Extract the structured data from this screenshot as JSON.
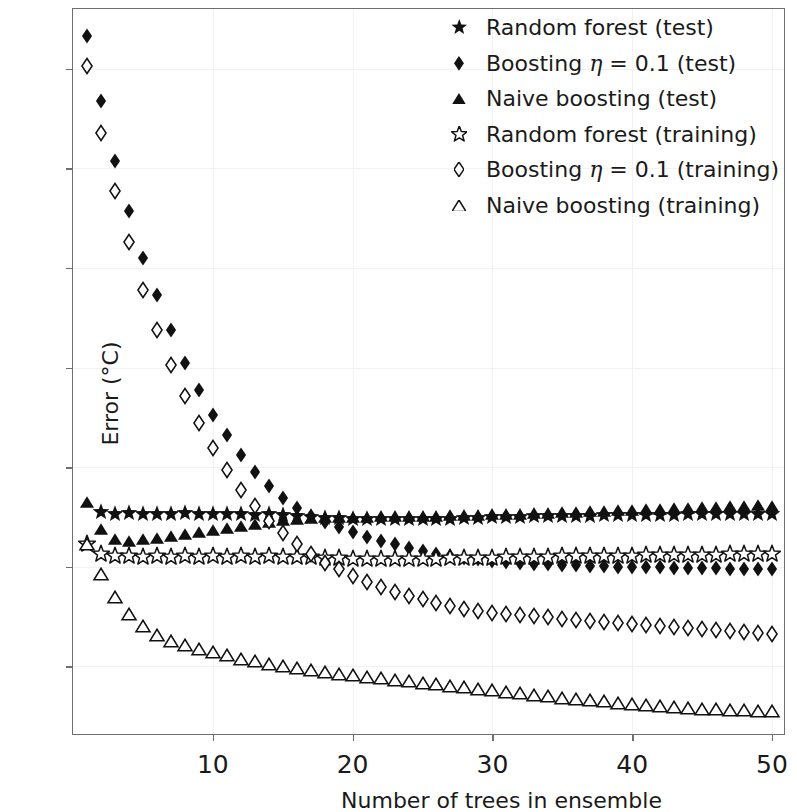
{
  "chart_data": {
    "type": "scatter",
    "title": "",
    "xlabel": "Number of trees in ensemble",
    "ylabel": "Error (°C)",
    "xlim": [
      0,
      51
    ],
    "ylim": [
      2.6,
      17.2
    ],
    "xticks": [
      10,
      20,
      30,
      40,
      50
    ],
    "yticks": [
      4,
      6,
      8,
      10,
      12,
      14,
      16
    ],
    "grid": true,
    "legend_position": "upper right",
    "x": [
      1,
      2,
      3,
      4,
      5,
      6,
      7,
      8,
      9,
      10,
      11,
      12,
      13,
      14,
      15,
      16,
      17,
      18,
      19,
      20,
      21,
      22,
      23,
      24,
      25,
      26,
      27,
      28,
      29,
      30,
      31,
      32,
      33,
      34,
      35,
      36,
      37,
      38,
      39,
      40,
      41,
      42,
      43,
      44,
      45,
      46,
      47,
      48,
      49,
      50
    ],
    "series": [
      {
        "name": "Random forest (test)",
        "marker": "star-filled",
        "filled": true,
        "values": [
          null,
          7.1,
          7.05,
          7.08,
          7.05,
          7.06,
          7.05,
          7.07,
          7.05,
          7.06,
          7.05,
          7.05,
          7.04,
          7.05,
          7.03,
          7.02,
          7.0,
          6.98,
          6.97,
          6.95,
          6.96,
          6.95,
          6.96,
          6.95,
          6.96,
          6.95,
          6.96,
          6.97,
          6.98,
          6.99,
          7.0,
          7.0,
          7.01,
          7.01,
          7.02,
          7.02,
          7.02,
          7.03,
          7.03,
          7.03,
          7.04,
          7.04,
          7.04,
          7.05,
          7.05,
          7.05,
          7.05,
          7.05,
          7.05,
          7.05
        ]
      },
      {
        "name": "Boosting η = 0.1 (test)",
        "marker": "diamond-filled",
        "filled": true,
        "values": [
          16.65,
          15.35,
          14.15,
          13.15,
          12.2,
          11.45,
          10.75,
          10.1,
          9.55,
          9.05,
          8.65,
          8.25,
          7.9,
          7.62,
          7.38,
          7.18,
          7.02,
          6.9,
          6.8,
          6.7,
          6.6,
          6.52,
          6.45,
          6.38,
          6.32,
          6.26,
          6.22,
          6.18,
          6.15,
          6.12,
          6.1,
          6.08,
          6.06,
          6.05,
          6.04,
          6.03,
          6.02,
          6.01,
          6.0,
          6.0,
          5.99,
          5.99,
          5.98,
          5.98,
          5.97,
          5.97,
          5.96,
          5.96,
          5.95,
          5.95
        ]
      },
      {
        "name": "Naive boosting (test)",
        "marker": "triangle-filled",
        "filled": true,
        "values": [
          7.3,
          6.75,
          6.55,
          6.52,
          6.55,
          6.58,
          6.62,
          6.66,
          6.7,
          6.74,
          6.78,
          6.82,
          6.86,
          6.9,
          6.93,
          6.95,
          6.97,
          6.99,
          7.0,
          7.0,
          7.0,
          7.01,
          7.01,
          7.02,
          7.02,
          7.02,
          7.03,
          7.03,
          7.04,
          7.05,
          7.05,
          7.06,
          7.07,
          7.08,
          7.09,
          7.1,
          7.11,
          7.12,
          7.13,
          7.14,
          7.15,
          7.16,
          7.17,
          7.18,
          7.19,
          7.2,
          7.21,
          7.22,
          7.23,
          7.22
        ]
      },
      {
        "name": "Random forest (training)",
        "marker": "star-open",
        "filled": false,
        "values": [
          6.45,
          6.25,
          6.22,
          6.22,
          6.2,
          6.22,
          6.2,
          6.21,
          6.2,
          6.21,
          6.2,
          6.21,
          6.2,
          6.21,
          6.2,
          6.2,
          6.19,
          6.18,
          6.17,
          6.16,
          6.16,
          6.15,
          6.16,
          6.15,
          6.16,
          6.16,
          6.17,
          6.17,
          6.18,
          6.18,
          6.19,
          6.19,
          6.2,
          6.2,
          6.21,
          6.21,
          6.21,
          6.22,
          6.22,
          6.22,
          6.23,
          6.23,
          6.23,
          6.24,
          6.24,
          6.24,
          6.25,
          6.25,
          6.25,
          6.25
        ]
      },
      {
        "name": "Boosting η = 0.1 (training)",
        "marker": "diamond-open",
        "filled": false,
        "values": [
          16.05,
          14.7,
          13.55,
          12.52,
          11.55,
          10.75,
          10.05,
          9.42,
          8.88,
          8.38,
          7.95,
          7.55,
          7.22,
          6.92,
          6.68,
          6.45,
          6.25,
          6.08,
          5.95,
          5.82,
          5.7,
          5.6,
          5.5,
          5.42,
          5.35,
          5.28,
          5.22,
          5.16,
          5.12,
          5.08,
          5.05,
          5.02,
          5.0,
          4.98,
          4.95,
          4.93,
          4.9,
          4.88,
          4.86,
          4.84,
          4.82,
          4.8,
          4.78,
          4.76,
          4.74,
          4.72,
          4.7,
          4.68,
          4.66,
          4.65
        ]
      },
      {
        "name": "Naive boosting (training)",
        "marker": "triangle-open",
        "filled": false,
        "values": [
          6.45,
          5.85,
          5.4,
          5.05,
          4.8,
          4.62,
          4.5,
          4.42,
          4.35,
          4.28,
          4.22,
          4.15,
          4.1,
          4.05,
          4.0,
          3.96,
          3.92,
          3.88,
          3.85,
          3.82,
          3.79,
          3.76,
          3.73,
          3.7,
          3.67,
          3.64,
          3.61,
          3.58,
          3.55,
          3.52,
          3.49,
          3.46,
          3.43,
          3.4,
          3.37,
          3.35,
          3.32,
          3.3,
          3.27,
          3.25,
          3.23,
          3.21,
          3.19,
          3.17,
          3.15,
          3.14,
          3.13,
          3.12,
          3.11,
          3.1
        ]
      }
    ]
  },
  "legend": {
    "items": [
      {
        "marker": "star-filled",
        "label": "Random forest (test)",
        "eta": false
      },
      {
        "marker": "diamond-filled",
        "label": "Boosting η = 0.1 (test)",
        "eta": true,
        "pre": "Boosting ",
        "post": " = 0.1 (test)"
      },
      {
        "marker": "triangle-filled",
        "label": "Naive boosting (test)",
        "eta": false
      },
      {
        "marker": "star-open",
        "label": "Random forest (training)",
        "eta": false
      },
      {
        "marker": "diamond-open",
        "label": "Boosting η = 0.1 (training)",
        "eta": true,
        "pre": "Boosting ",
        "post": " = 0.1 (training)"
      },
      {
        "marker": "triangle-open",
        "label": "Naive boosting (training)",
        "eta": false
      }
    ]
  },
  "style": {
    "marker_color": "#111111",
    "axis_color": "#6f6f6f",
    "grid_color": "#f2f2f2",
    "background": "#ffffff"
  }
}
